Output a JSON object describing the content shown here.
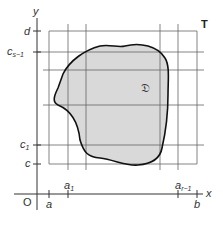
{
  "figure": {
    "axes": {
      "x_label": "x",
      "y_label": "y",
      "origin_label": "O"
    },
    "x_ticks": {
      "a": "a",
      "a1_base": "a",
      "a1_sub": "1",
      "ar_base": "a",
      "ar_sub": "r−1",
      "b": "b"
    },
    "y_ticks": {
      "d": "d",
      "cs_base": "c",
      "cs_sub": "s−1",
      "c1_base": "c",
      "c1_sub": "1",
      "c": "c"
    },
    "region_label": "𝔇",
    "rectangle_label": "T",
    "colors": {
      "region_fill": "#d9d9d9",
      "grid": "#555555",
      "boundary": "#111111",
      "text": "#333333"
    }
  }
}
